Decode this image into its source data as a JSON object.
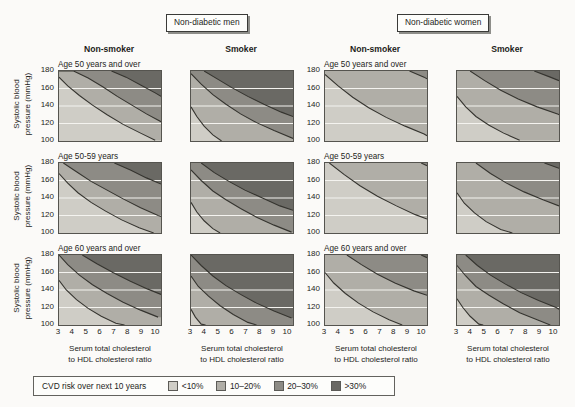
{
  "groups": [
    {
      "label": "Non-diabetic men"
    },
    {
      "label": "Non-diabetic women"
    }
  ],
  "columns": [
    {
      "label": "Non-smoker",
      "group": "Non-diabetic men",
      "smoker": false
    },
    {
      "label": "Smoker",
      "group": "Non-diabetic men",
      "smoker": true
    },
    {
      "label": "Non-smoker",
      "group": "Non-diabetic women",
      "smoker": false
    },
    {
      "label": "Smoker",
      "group": "Non-diabetic women",
      "smoker": true
    }
  ],
  "rows": [
    {
      "label": "Age 50 years and over"
    },
    {
      "label": "Age 50-59 years"
    },
    {
      "label": "Age 60 years and over"
    }
  ],
  "axes": {
    "ylabel_line1": "Systolic blood",
    "ylabel_line2": "pressure (mmHg)",
    "yticks": [
      "180",
      "160",
      "140",
      "120",
      "100"
    ],
    "ylim": [
      100,
      180
    ],
    "xlabel_line1": "Serum total cholesterol",
    "xlabel_line2": "to HDL cholesterol ratio",
    "xticks": [
      "3",
      "4",
      "5",
      "6",
      "7",
      "8",
      "9",
      "10"
    ],
    "xlim": [
      3,
      10
    ],
    "gridlines_y": [
      120,
      140,
      160
    ],
    "grid_color": "#f4f3ef"
  },
  "legend": {
    "title": "CVD risk over next 10 years",
    "items": [
      {
        "label": "<10%",
        "color": "#cfcdc6"
      },
      {
        "label": "10–20%",
        "color": "#b0aea7"
      },
      {
        "label": "20–30%",
        "color": "#8d8b85"
      },
      {
        "label": ">30%",
        "color": "#6a6964"
      }
    ]
  },
  "chart_data": {
    "type": "contour",
    "xlabel": "Serum total cholesterol to HDL cholesterol ratio",
    "ylabel": "Systolic blood pressure (mmHg)",
    "xlim": [
      3,
      10
    ],
    "ylim": [
      100,
      180
    ],
    "grid": true,
    "legend_position": "bottom",
    "band_labels": [
      "<10%",
      "10–20%",
      "20–30%",
      ">30%"
    ],
    "band_colors": [
      "#cfcdc6",
      "#b0aea7",
      "#8d8b85",
      "#6a6964"
    ],
    "contour_levels": [
      10,
      20,
      30
    ],
    "panels": [
      {
        "group": "Non-diabetic men",
        "smoker": false,
        "age": "Age 50 years and over",
        "row": 0,
        "col": 0,
        "contours": {
          "10": [
            [
              3,
              173
            ],
            [
              3.6,
              163
            ],
            [
              4.4,
              152
            ],
            [
              5.3,
              141
            ],
            [
              6.3,
              130
            ],
            [
              7.4,
              119
            ],
            [
              8.6,
              109
            ],
            [
              9.6,
              101
            ]
          ],
          "20": [
            [
              3,
              180
            ],
            [
              4.0,
              180
            ],
            [
              5.0,
              172
            ],
            [
              6.0,
              162
            ],
            [
              7.0,
              151
            ],
            [
              8.0,
              141
            ],
            [
              9.0,
              131
            ],
            [
              10,
              122
            ]
          ],
          "30": [
            [
              6.6,
              180
            ],
            [
              7.6,
              173
            ],
            [
              8.6,
              164
            ],
            [
              9.6,
              155
            ],
            [
              10,
              151
            ]
          ]
        }
      },
      {
        "group": "Non-diabetic men",
        "smoker": true,
        "age": "Age 50 years and over",
        "row": 0,
        "col": 1,
        "contours": {
          "10": [
            [
              3,
              139
            ],
            [
              3.4,
              128
            ],
            [
              3.9,
              117
            ],
            [
              4.5,
              107
            ],
            [
              5.1,
              100
            ]
          ],
          "20": [
            [
              3,
              177
            ],
            [
              3.7,
              165
            ],
            [
              4.5,
              153
            ],
            [
              5.4,
              142
            ],
            [
              6.4,
              131
            ],
            [
              7.5,
              121
            ],
            [
              8.7,
              112
            ],
            [
              10,
              103
            ]
          ],
          "30": [
            [
              3.9,
              180
            ],
            [
              4.8,
              171
            ],
            [
              5.8,
              161
            ],
            [
              6.9,
              151
            ],
            [
              8.0,
              142
            ],
            [
              9.2,
              133
            ],
            [
              10,
              128
            ]
          ]
        }
      },
      {
        "group": "Non-diabetic women",
        "smoker": false,
        "age": "Age 50 years and over",
        "row": 0,
        "col": 2,
        "contours": {
          "10": [
            [
              3,
              176
            ],
            [
              3.9,
              163
            ],
            [
              4.9,
              150
            ],
            [
              6.0,
              138
            ],
            [
              7.2,
              127
            ],
            [
              8.5,
              117
            ],
            [
              9.8,
              108
            ],
            [
              10,
              106
            ]
          ],
          "20": [
            [
              8.8,
              180
            ],
            [
              9.8,
              173
            ],
            [
              10,
              171
            ]
          ],
          "30": []
        }
      },
      {
        "group": "Non-diabetic women",
        "smoker": true,
        "age": "Age 50 years and over",
        "row": 0,
        "col": 3,
        "contours": {
          "10": [
            [
              3,
              151
            ],
            [
              3.6,
              139
            ],
            [
              4.3,
              128
            ],
            [
              5.2,
              118
            ],
            [
              6.2,
              109
            ],
            [
              7.3,
              101
            ]
          ],
          "20": [
            [
              3.9,
              180
            ],
            [
              4.9,
              169
            ],
            [
              6.0,
              158
            ],
            [
              7.2,
              148
            ],
            [
              8.5,
              139
            ],
            [
              9.9,
              131
            ],
            [
              10,
              130
            ]
          ],
          "30": [
            [
              8.3,
              180
            ],
            [
              9.4,
              173
            ],
            [
              10,
              169
            ]
          ]
        }
      },
      {
        "group": "Non-diabetic men",
        "smoker": false,
        "age": "Age 50-59 years",
        "row": 1,
        "col": 0,
        "contours": {
          "10": [
            [
              3,
              168
            ],
            [
              3.6,
              157
            ],
            [
              4.3,
              146
            ],
            [
              5.2,
              135
            ],
            [
              6.2,
              125
            ],
            [
              7.3,
              115
            ],
            [
              8.5,
              106
            ],
            [
              9.5,
              100
            ]
          ],
          "20": [
            [
              3.3,
              180
            ],
            [
              4.2,
              170
            ],
            [
              5.2,
              159
            ],
            [
              6.3,
              149
            ],
            [
              7.4,
              139
            ],
            [
              8.6,
              129
            ],
            [
              9.8,
              120
            ],
            [
              10,
              119
            ]
          ],
          "30": [
            [
              6.8,
              180
            ],
            [
              7.9,
              172
            ],
            [
              9.0,
              163
            ],
            [
              10,
              156
            ]
          ]
        }
      },
      {
        "group": "Non-diabetic men",
        "smoker": true,
        "age": "Age 50-59 years",
        "row": 1,
        "col": 1,
        "contours": {
          "10": [
            [
              3,
              135
            ],
            [
              3.4,
              124
            ],
            [
              3.9,
              114
            ],
            [
              4.5,
              105
            ],
            [
              5.0,
              100
            ]
          ],
          "20": [
            [
              3,
              172
            ],
            [
              3.7,
              160
            ],
            [
              4.5,
              148
            ],
            [
              5.4,
              138
            ],
            [
              6.4,
              128
            ],
            [
              7.5,
              118
            ],
            [
              8.7,
              109
            ],
            [
              9.9,
              101
            ]
          ],
          "30": [
            [
              3.7,
              180
            ],
            [
              4.6,
              169
            ],
            [
              5.6,
              159
            ],
            [
              6.7,
              149
            ],
            [
              7.9,
              140
            ],
            [
              9.1,
              131
            ],
            [
              10,
              126
            ]
          ]
        }
      },
      {
        "group": "Non-diabetic women",
        "smoker": false,
        "age": "Age 50-59 years",
        "row": 1,
        "col": 2,
        "contours": {
          "10": [
            [
              3.3,
              180
            ],
            [
              4.3,
              167
            ],
            [
              5.4,
              154
            ],
            [
              6.6,
              142
            ],
            [
              7.9,
              131
            ],
            [
              9.2,
              121
            ],
            [
              10,
              116
            ]
          ],
          "20": [
            [
              9.6,
              180
            ],
            [
              10,
              177
            ]
          ],
          "30": []
        }
      },
      {
        "group": "Non-diabetic women",
        "smoker": true,
        "age": "Age 50-59 years",
        "row": 1,
        "col": 3,
        "contours": {
          "10": [
            [
              3,
              146
            ],
            [
              3.5,
              134
            ],
            [
              4.2,
              123
            ],
            [
              5.0,
              113
            ],
            [
              6.0,
              104
            ],
            [
              6.8,
              100
            ]
          ],
          "20": [
            [
              4.3,
              180
            ],
            [
              5.3,
              168
            ],
            [
              6.4,
              157
            ],
            [
              7.6,
              147
            ],
            [
              8.9,
              138
            ],
            [
              10,
              131
            ]
          ],
          "30": [
            [
              9.0,
              180
            ],
            [
              10,
              174
            ]
          ]
        }
      },
      {
        "group": "Non-diabetic men",
        "smoker": false,
        "age": "Age 60 years and over",
        "row": 2,
        "col": 0,
        "contours": {
          "10": [
            [
              3,
              151
            ],
            [
              3.5,
              140
            ],
            [
              4.2,
              129
            ],
            [
              5.0,
              119
            ],
            [
              5.9,
              110
            ],
            [
              6.9,
              102
            ],
            [
              7.5,
              100
            ]
          ],
          "20": [
            [
              3,
              180
            ],
            [
              3.6,
              169
            ],
            [
              4.4,
              157
            ],
            [
              5.3,
              146
            ],
            [
              6.3,
              136
            ],
            [
              7.4,
              126
            ],
            [
              8.6,
              117
            ],
            [
              9.8,
              109
            ]
          ],
          "30": [
            [
              4.6,
              180
            ],
            [
              5.6,
              170
            ],
            [
              6.7,
              160
            ],
            [
              7.9,
              150
            ],
            [
              9.1,
              141
            ],
            [
              10,
              135
            ]
          ]
        }
      },
      {
        "group": "Non-diabetic men",
        "smoker": true,
        "age": "Age 60 years and over",
        "row": 2,
        "col": 1,
        "contours": {
          "10": [
            [
              3,
              118
            ],
            [
              3.3,
              109
            ],
            [
              3.7,
              101
            ],
            [
              4.0,
              100
            ]
          ],
          "20": [
            [
              3,
              156
            ],
            [
              3.5,
              144
            ],
            [
              4.2,
              133
            ],
            [
              5.0,
              122
            ],
            [
              5.9,
              112
            ],
            [
              6.9,
              103
            ],
            [
              7.5,
              100
            ]
          ],
          "30": [
            [
              3,
              180
            ],
            [
              3.7,
              168
            ],
            [
              4.5,
              156
            ],
            [
              5.4,
              145
            ],
            [
              6.4,
              135
            ],
            [
              7.5,
              125
            ],
            [
              8.7,
              116
            ],
            [
              9.9,
              108
            ]
          ]
        }
      },
      {
        "group": "Non-diabetic women",
        "smoker": false,
        "age": "Age 60 years and over",
        "row": 2,
        "col": 2,
        "contours": {
          "10": [
            [
              3,
              160
            ],
            [
              3.6,
              148
            ],
            [
              4.4,
              136
            ],
            [
              5.3,
              125
            ],
            [
              6.3,
              115
            ],
            [
              7.4,
              106
            ],
            [
              8.3,
              100
            ]
          ],
          "20": [
            [
              4.5,
              180
            ],
            [
              5.5,
              169
            ],
            [
              6.6,
              158
            ],
            [
              7.8,
              148
            ],
            [
              9.1,
              139
            ],
            [
              10,
              134
            ]
          ],
          "30": [
            [
              9.6,
              180
            ],
            [
              10,
              177
            ]
          ]
        }
      },
      {
        "group": "Non-diabetic women",
        "smoker": true,
        "age": "Age 60 years and over",
        "row": 2,
        "col": 3,
        "contours": {
          "10": [
            [
              3,
              130
            ],
            [
              3.4,
              120
            ],
            [
              3.9,
              110
            ],
            [
              4.5,
              101
            ],
            [
              4.8,
              100
            ]
          ],
          "20": [
            [
              3,
              168
            ],
            [
              3.6,
              156
            ],
            [
              4.3,
              144
            ],
            [
              5.2,
              134
            ],
            [
              6.2,
              124
            ],
            [
              7.3,
              114
            ],
            [
              8.5,
              106
            ],
            [
              9.4,
              100
            ]
          ],
          "30": [
            [
              3.6,
              180
            ],
            [
              4.4,
              168
            ],
            [
              5.3,
              157
            ],
            [
              6.3,
              147
            ],
            [
              7.4,
              137
            ],
            [
              8.6,
              128
            ],
            [
              9.8,
              120
            ],
            [
              10,
              118
            ]
          ]
        }
      }
    ]
  }
}
